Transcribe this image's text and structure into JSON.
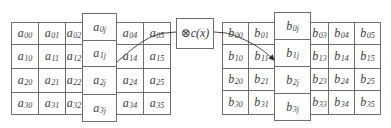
{
  "diagram": {
    "type": "mixcolumns-transform",
    "operator": {
      "symbol": "⊗",
      "label": "c(x)"
    },
    "left_matrix": {
      "name": "a",
      "rows": [
        [
          "a",
          "00",
          "a",
          "01",
          "a",
          "02",
          "a",
          "0j",
          "a",
          "04",
          "a",
          "05"
        ],
        [
          "a",
          "10",
          "a",
          "11",
          "a",
          "12",
          "a",
          "1j",
          "a",
          "14",
          "a",
          "15"
        ],
        [
          "a",
          "20",
          "a",
          "21",
          "a",
          "22",
          "a",
          "2j",
          "a",
          "24",
          "a",
          "25"
        ],
        [
          "a",
          "30",
          "a",
          "31",
          "a",
          "32",
          "a",
          "3j",
          "a",
          "34",
          "a",
          "35"
        ]
      ],
      "cells": [
        [
          "00",
          "01",
          "02",
          "04",
          "05"
        ],
        [
          "10",
          "11",
          "12",
          "14",
          "15"
        ],
        [
          "20",
          "21",
          "22",
          "24",
          "25"
        ],
        [
          "30",
          "31",
          "32",
          "34",
          "35"
        ]
      ],
      "highlight_column": [
        "0j",
        "1j",
        "2j",
        "3j"
      ]
    },
    "right_matrix": {
      "name": "b",
      "cells": [
        [
          "00",
          "01",
          "03",
          "04",
          "05"
        ],
        [
          "10",
          "11",
          "13",
          "14",
          "15"
        ],
        [
          "20",
          "21",
          "23",
          "24",
          "25"
        ],
        [
          "30",
          "31",
          "33",
          "34",
          "35"
        ]
      ],
      "highlight_column": [
        "0j",
        "1j",
        "2j",
        "3j"
      ]
    },
    "connections": [
      {
        "from": "a-column-j",
        "to": "operator",
        "style": "curve"
      },
      {
        "from": "operator",
        "to": "b-column-j",
        "style": "arrow"
      }
    ]
  }
}
